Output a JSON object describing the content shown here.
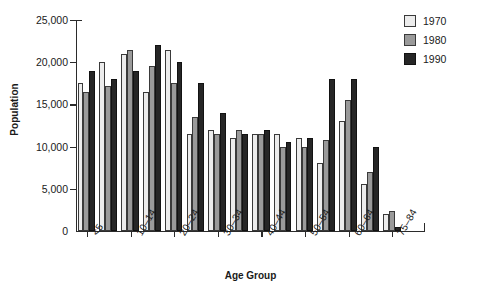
{
  "chart_data": {
    "type": "bar",
    "title": "",
    "xlabel": "Age Group",
    "ylabel": "Population",
    "ylim": [
      0,
      25000
    ],
    "yticks": [
      0,
      5000,
      10000,
      15000,
      20000,
      25000
    ],
    "ytick_labels": [
      "0",
      "5,000",
      "10,000",
      "15,000",
      "20,000",
      "25,000"
    ],
    "grid": false,
    "legend_position": "top-right",
    "categories": [
      "<5",
      "5–9",
      "10–14",
      "15–19",
      "20–24",
      "25–29",
      "30–34",
      "35–39",
      "40–44",
      "45–49",
      "50–54",
      "55–59",
      "60–64",
      "65–74",
      "75–84",
      "85+"
    ],
    "xtick_labels_shown": [
      "<5",
      "10–14",
      "20–24",
      "30–34",
      "40–44",
      "50–54",
      "60–64",
      "75–84"
    ],
    "xtick_label_category_indices": [
      0,
      2,
      4,
      6,
      8,
      10,
      12,
      14
    ],
    "series": [
      {
        "name": "1970",
        "color": "#ececec",
        "values": [
          17500,
          20000,
          21000,
          16500,
          21500,
          11500,
          12000,
          11000,
          11500,
          11500,
          11000,
          8000,
          13000,
          5600,
          2000,
          0
        ]
      },
      {
        "name": "1980",
        "color": "#9a9a9a",
        "values": [
          16500,
          17200,
          21500,
          19500,
          17500,
          13500,
          11500,
          12000,
          11500,
          10000,
          10000,
          10800,
          15500,
          7000,
          2400,
          0
        ]
      },
      {
        "name": "1990",
        "color": "#262626",
        "values": [
          19000,
          18000,
          19000,
          22000,
          20000,
          17500,
          14000,
          11500,
          12000,
          10500,
          11000,
          18000,
          18000,
          10000,
          500,
          0
        ]
      }
    ]
  },
  "legend": {
    "entries": [
      {
        "label": "1970",
        "swatch_class": "s1970",
        "color": "#ececec"
      },
      {
        "label": "1980",
        "swatch_class": "s1980",
        "color": "#9a9a9a"
      },
      {
        "label": "1990",
        "swatch_class": "s1990",
        "color": "#262626"
      }
    ]
  },
  "axes": {
    "y_title": "Population",
    "x_title": "Age Group"
  }
}
